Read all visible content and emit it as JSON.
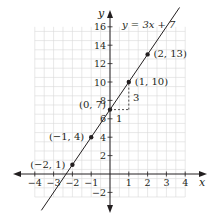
{
  "chart_data": {
    "type": "line",
    "title": "",
    "xlabel": "x",
    "ylabel": "y",
    "xlim": [
      -4,
      4
    ],
    "ylim": [
      -2,
      16
    ],
    "grid": true,
    "x_ticks": [
      -4,
      -3,
      -2,
      -1,
      1,
      2,
      3,
      4
    ],
    "x_tick_labels": [
      "−4",
      "−3",
      "−2",
      "−1",
      "1",
      "2",
      "3",
      "4"
    ],
    "y_ticks": [
      -2,
      2,
      4,
      6,
      8,
      10,
      12,
      14,
      16
    ],
    "y_tick_labels": [
      "−2",
      "2",
      "4",
      "6",
      "8",
      "10",
      "12",
      "14",
      "16"
    ],
    "series": [
      {
        "name": "y = 3x + 7",
        "equation": "y = 3x + 7",
        "slope": 3,
        "intercept": 7,
        "x": [
          -2,
          -1,
          0,
          1,
          2
        ],
        "values": [
          1,
          4,
          7,
          10,
          13
        ]
      }
    ],
    "points": [
      {
        "x": -2,
        "y": 1,
        "label": "(−2, 1)"
      },
      {
        "x": -1,
        "y": 4,
        "label": "(−1, 4)"
      },
      {
        "x": 0,
        "y": 7,
        "label": "(0, 7)"
      },
      {
        "x": 1,
        "y": 10,
        "label": "(1, 10)"
      },
      {
        "x": 2,
        "y": 13,
        "label": "(2, 13)"
      }
    ],
    "annotations": [
      {
        "text": "y = 3x + 7",
        "type": "equation-label"
      },
      {
        "text": "1",
        "type": "run",
        "from": [
          0,
          7
        ],
        "to": [
          1,
          7
        ]
      },
      {
        "text": "3",
        "type": "rise",
        "from": [
          1,
          7
        ],
        "to": [
          1,
          10
        ]
      }
    ]
  },
  "labels": {
    "x_axis": "x",
    "y_axis": "y",
    "equation": "y = 3x + 7",
    "run": "1",
    "rise": "3",
    "points": [
      "(−2, 1)",
      "(−1, 4)",
      "(0, 7)",
      "(1, 10)",
      "(2, 13)"
    ]
  },
  "colors": {
    "line": "#231f20",
    "grid": "#d9d9d9",
    "axis": "#231f20",
    "point": "#231f20"
  }
}
